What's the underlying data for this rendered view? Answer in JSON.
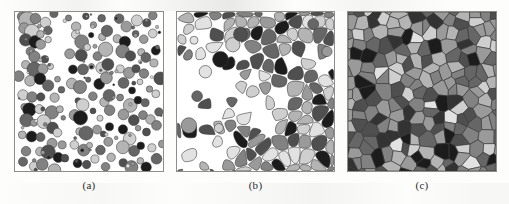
{
  "figure": {
    "panel_count": 3,
    "background_color": "#ffffff",
    "border_color": "#8d8d8d",
    "palette": {
      "near_black": "#1c1c1c",
      "very_dark": "#333333",
      "dark_gray": "#4f4f4f",
      "mid_dark_gray": "#666666",
      "mid_gray": "#828282",
      "mid_light_gray": "#9a9a9a",
      "light_gray": "#b4b4b4",
      "pale_gray": "#cfcfcf",
      "very_pale_gray": "#e2e2e2",
      "pore_white": "#ffffff",
      "outline": "#3a3a3a"
    }
  },
  "panels": [
    {
      "id": "a",
      "caption": "(a)",
      "stage": "loose-powder-compact",
      "description": "Discrete spherical particles with large inter-particle pore space",
      "geometry": "circles"
    },
    {
      "id": "b",
      "caption": "(b)",
      "stage": "intermediate-sintering",
      "description": "Rounded grains with flattened contact facets, necking and residual porosity",
      "geometry": "rounded-polygons"
    },
    {
      "id": "c",
      "caption": "(c)",
      "stage": "final-sintering",
      "description": "Fully dense polygonal grain structure with no remaining porosity",
      "geometry": "polygons"
    }
  ],
  "chart_data": {
    "type": "diagram",
    "title": "",
    "subtitle": "",
    "panel_labels": [
      "(a)",
      "(b)",
      "(c)"
    ],
    "series": [
      {
        "name": "panel-a-particles",
        "note": "x, y, radius in panel-local units (0-150 x, 0-161 y); tone index into palette_ramp",
        "palette_ramp": [
          "#1c1c1c",
          "#4f4f4f",
          "#666666",
          "#828282",
          "#9a9a9a",
          "#b4b4b4",
          "#cfcfcf",
          "#e2e2e2"
        ],
        "values": [
          [
            6,
            5,
            5,
            3
          ],
          [
            13,
            7,
            6,
            5
          ],
          [
            22,
            6,
            4,
            3
          ],
          [
            29,
            10,
            4,
            6
          ],
          [
            38,
            4,
            3,
            2
          ],
          [
            8,
            16,
            5,
            4
          ],
          [
            16,
            19,
            6,
            6
          ],
          [
            12,
            27,
            5,
            1
          ],
          [
            19,
            31,
            5,
            0
          ],
          [
            14,
            38,
            4,
            3
          ],
          [
            25,
            22,
            4,
            5
          ],
          [
            33,
            18,
            3,
            2
          ],
          [
            27,
            34,
            5,
            4
          ],
          [
            35,
            30,
            4,
            6
          ],
          [
            20,
            45,
            5,
            3
          ],
          [
            31,
            47,
            4,
            1
          ],
          [
            9,
            52,
            4,
            5
          ],
          [
            17,
            58,
            5,
            2
          ],
          [
            26,
            60,
            4,
            4
          ],
          [
            37,
            55,
            3,
            6
          ],
          [
            6,
            66,
            4,
            3
          ],
          [
            14,
            72,
            5,
            5
          ],
          [
            23,
            70,
            4,
            0
          ],
          [
            33,
            75,
            4,
            2
          ],
          [
            41,
            68,
            3,
            4
          ],
          [
            10,
            82,
            5,
            6
          ],
          [
            19,
            86,
            4,
            3
          ],
          [
            28,
            84,
            5,
            1
          ],
          [
            38,
            88,
            4,
            5
          ],
          [
            46,
            80,
            3,
            2
          ],
          [
            7,
            95,
            4,
            4
          ],
          [
            16,
            99,
            5,
            0
          ],
          [
            25,
            97,
            4,
            6
          ],
          [
            35,
            102,
            5,
            3
          ],
          [
            44,
            96,
            3,
            5
          ],
          [
            11,
            110,
            5,
            2
          ],
          [
            21,
            114,
            4,
            4
          ],
          [
            30,
            112,
            5,
            6
          ],
          [
            40,
            118,
            4,
            1
          ],
          [
            48,
            108,
            3,
            3
          ],
          [
            8,
            124,
            4,
            5
          ],
          [
            18,
            128,
            5,
            0
          ],
          [
            27,
            126,
            4,
            2
          ],
          [
            37,
            131,
            5,
            4
          ],
          [
            45,
            123,
            3,
            6
          ],
          [
            13,
            139,
            5,
            3
          ],
          [
            23,
            143,
            4,
            5
          ],
          [
            32,
            141,
            5,
            1
          ],
          [
            42,
            146,
            4,
            0
          ],
          [
            50,
            137,
            3,
            4
          ],
          [
            10,
            152,
            4,
            2
          ],
          [
            20,
            156,
            5,
            6
          ],
          [
            30,
            154,
            4,
            3
          ],
          [
            40,
            158,
            5,
            5
          ],
          [
            49,
            150,
            3,
            1
          ],
          [
            56,
            8,
            4,
            3
          ],
          [
            64,
            13,
            5,
            5
          ],
          [
            72,
            6,
            3,
            1
          ],
          [
            80,
            11,
            4,
            4
          ],
          [
            88,
            7,
            5,
            2
          ],
          [
            60,
            24,
            4,
            6
          ],
          [
            69,
            28,
            5,
            3
          ],
          [
            77,
            22,
            3,
            0
          ],
          [
            86,
            27,
            4,
            5
          ],
          [
            94,
            20,
            5,
            2
          ],
          [
            57,
            40,
            4,
            4
          ],
          [
            66,
            44,
            5,
            1
          ],
          [
            75,
            38,
            3,
            6
          ],
          [
            84,
            43,
            4,
            3
          ],
          [
            92,
            36,
            5,
            5
          ],
          [
            61,
            56,
            4,
            0
          ],
          [
            70,
            60,
            5,
            2
          ],
          [
            79,
            54,
            3,
            4
          ],
          [
            88,
            59,
            4,
            6
          ],
          [
            96,
            52,
            5,
            1
          ],
          [
            58,
            72,
            4,
            5
          ],
          [
            67,
            76,
            5,
            3
          ],
          [
            76,
            70,
            3,
            2
          ],
          [
            85,
            75,
            4,
            0
          ],
          [
            93,
            68,
            5,
            4
          ],
          [
            62,
            88,
            4,
            1
          ],
          [
            71,
            92,
            5,
            6
          ],
          [
            80,
            86,
            3,
            3
          ],
          [
            89,
            91,
            4,
            5
          ],
          [
            97,
            84,
            5,
            2
          ],
          [
            59,
            104,
            4,
            4
          ],
          [
            68,
            108,
            5,
            0
          ],
          [
            77,
            102,
            3,
            1
          ],
          [
            86,
            107,
            4,
            6
          ],
          [
            94,
            100,
            5,
            3
          ],
          [
            63,
            120,
            4,
            5
          ],
          [
            72,
            124,
            5,
            2
          ],
          [
            81,
            118,
            3,
            4
          ],
          [
            90,
            123,
            4,
            1
          ],
          [
            98,
            116,
            5,
            0
          ],
          [
            60,
            136,
            4,
            6
          ],
          [
            69,
            140,
            5,
            3
          ],
          [
            78,
            134,
            3,
            5
          ],
          [
            87,
            139,
            4,
            2
          ],
          [
            95,
            132,
            5,
            4
          ],
          [
            64,
            152,
            4,
            0
          ],
          [
            73,
            156,
            5,
            1
          ],
          [
            82,
            150,
            3,
            6
          ],
          [
            91,
            155,
            4,
            3
          ],
          [
            99,
            148,
            5,
            5
          ],
          [
            106,
            9,
            5,
            2
          ],
          [
            115,
            14,
            4,
            4
          ],
          [
            124,
            7,
            5,
            6
          ],
          [
            133,
            12,
            4,
            1
          ],
          [
            142,
            6,
            3,
            3
          ],
          [
            104,
            25,
            4,
            5
          ],
          [
            113,
            30,
            5,
            0
          ],
          [
            122,
            23,
            3,
            2
          ],
          [
            131,
            28,
            4,
            4
          ],
          [
            140,
            21,
            5,
            6
          ],
          [
            108,
            41,
            5,
            3
          ],
          [
            117,
            46,
            4,
            1
          ],
          [
            126,
            39,
            3,
            5
          ],
          [
            135,
            44,
            4,
            2
          ],
          [
            144,
            37,
            5,
            0
          ],
          [
            105,
            57,
            4,
            6
          ],
          [
            114,
            62,
            5,
            4
          ],
          [
            123,
            55,
            3,
            1
          ],
          [
            132,
            60,
            4,
            3
          ],
          [
            141,
            53,
            5,
            5
          ],
          [
            109,
            73,
            5,
            2
          ],
          [
            118,
            78,
            4,
            0
          ],
          [
            127,
            71,
            3,
            6
          ],
          [
            136,
            76,
            4,
            4
          ],
          [
            145,
            69,
            5,
            1
          ],
          [
            106,
            89,
            4,
            3
          ],
          [
            115,
            94,
            5,
            5
          ],
          [
            124,
            87,
            3,
            0
          ],
          [
            133,
            92,
            4,
            2
          ],
          [
            142,
            85,
            5,
            6
          ],
          [
            110,
            105,
            5,
            4
          ],
          [
            119,
            110,
            4,
            1
          ],
          [
            128,
            103,
            3,
            3
          ],
          [
            137,
            108,
            4,
            5
          ],
          [
            146,
            101,
            5,
            2
          ],
          [
            107,
            121,
            4,
            0
          ],
          [
            116,
            126,
            5,
            6
          ],
          [
            125,
            119,
            3,
            4
          ],
          [
            134,
            124,
            4,
            1
          ],
          [
            143,
            117,
            5,
            3
          ],
          [
            111,
            137,
            5,
            5
          ],
          [
            120,
            142,
            4,
            2
          ],
          [
            129,
            135,
            3,
            0
          ],
          [
            138,
            140,
            4,
            6
          ],
          [
            147,
            133,
            5,
            4
          ],
          [
            108,
            153,
            4,
            1
          ],
          [
            117,
            158,
            5,
            3
          ],
          [
            126,
            151,
            3,
            5
          ],
          [
            135,
            156,
            4,
            0
          ],
          [
            144,
            149,
            5,
            2
          ]
        ]
      },
      {
        "name": "panel-b-grains",
        "note": "Voronoi-like seeds with rounding; dense cluster on right, porous on left",
        "seed_count": 120
      },
      {
        "name": "panel-c-grains",
        "note": "Fully space-filling Voronoi polygons, no pores",
        "seed_count": 150
      }
    ]
  }
}
